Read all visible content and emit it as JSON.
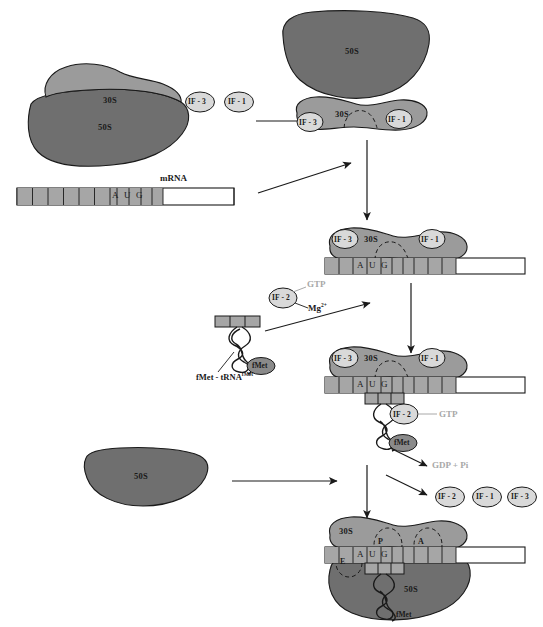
{
  "diagram": {
    "colors": {
      "subunit_30s": "#9b9b9b",
      "subunit_50s": "#6f6f6f",
      "mrna_coding": "#a6a6a6",
      "mrna_untranslated": "#ffffff",
      "factor_circle": "#d9d9d9",
      "fmet_blob": "#8a8a8a",
      "outline": "#1a1a1a",
      "gtp_text": "#a8a8a8",
      "codon_text": "#1a1a1a"
    }
  },
  "stage1": {
    "ribosome_70s": {
      "small_label": "30S",
      "large_label": "50S"
    },
    "factors": [
      {
        "label": "IF - 3",
        "name": "IF-3"
      },
      {
        "label": "IF - 1",
        "name": "IF-1"
      }
    ],
    "mrna": {
      "label": "mRNA",
      "codon": [
        "A",
        "U",
        "G"
      ],
      "leader_cells": 7,
      "trailer_cells": 3,
      "utr_label": ""
    }
  },
  "stage2": {
    "free_50s_label": "50S",
    "small_subunit_label": "30S",
    "bound_factors": [
      {
        "label": "IF - 3",
        "name": "IF-3"
      },
      {
        "label": "IF - 1",
        "name": "IF-1"
      }
    ]
  },
  "stage3": {
    "subunit_label": "30S",
    "bound_factors": [
      {
        "label": "IF - 3",
        "name": "IF-3"
      },
      {
        "label": "IF - 1",
        "name": "IF-1"
      }
    ],
    "mrna_codon": [
      "A",
      "U",
      "G"
    ]
  },
  "trna_input": {
    "factor": {
      "label": "IF - 2",
      "name": "IF-2"
    },
    "gtp_label": "GTP",
    "mg_label": "Mg",
    "mg_charge": "2+",
    "fmet_label": "fMet",
    "trna_label": "fMet - tRNA",
    "trna_superscript": "fMet"
  },
  "stage4": {
    "subunit_label": "30S",
    "bound_factors": [
      {
        "label": "IF - 3",
        "name": "IF-3"
      },
      {
        "label": "IF - 1",
        "name": "IF-1"
      }
    ],
    "if2": {
      "label": "IF - 2",
      "name": "IF-2"
    },
    "gtp_label": "GTP",
    "fmet_label": "fMet",
    "mrna_codon": [
      "A",
      "U",
      "G"
    ],
    "anticodon": [
      "U",
      "A",
      "C"
    ]
  },
  "stage5": {
    "free_50s_label": "50S",
    "released_products": "GDP + Pi",
    "released_factors": [
      {
        "label": "IF - 2",
        "name": "IF-2"
      },
      {
        "label": "IF - 1",
        "name": "IF-1"
      },
      {
        "label": "IF - 3",
        "name": "IF-3"
      }
    ]
  },
  "stage6": {
    "small_subunit_label": "30S",
    "large_subunit_label": "50S",
    "sites": [
      {
        "label": "E",
        "name": "e-site"
      },
      {
        "label": "P",
        "name": "p-site"
      },
      {
        "label": "A",
        "name": "a-site"
      }
    ],
    "mrna_codon": [
      "A",
      "U",
      "G"
    ],
    "anticodon": [
      "U",
      "A",
      "C"
    ],
    "fmet_label": "fMet"
  }
}
